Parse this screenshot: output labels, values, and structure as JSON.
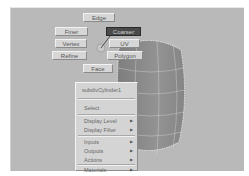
{
  "marking_menu": {
    "north": "Edge",
    "northwest": "Finer",
    "northeast": "Coarser",
    "west": "Vertex",
    "east": "UV",
    "southwest": "Refine",
    "southeast": "Polygon",
    "south": "Face",
    "highlighted": "Coarser"
  },
  "context_menu": {
    "title": "subdivCylinder1",
    "items": [
      {
        "label": "Select",
        "submenu": false
      },
      {
        "label": "Display Level",
        "submenu": true
      },
      {
        "label": "Display Filter",
        "submenu": true
      },
      {
        "label": "Inputs",
        "submenu": true
      },
      {
        "label": "Outputs",
        "submenu": true
      },
      {
        "label": "Actions",
        "submenu": true
      },
      {
        "label": "Materials",
        "submenu": true
      }
    ],
    "arrow_glyph": "▶"
  },
  "colors": {
    "viewport_bg": "#b9b9b9",
    "object_fill": "#8c8c8c",
    "highlight": "#4a4a4a"
  }
}
